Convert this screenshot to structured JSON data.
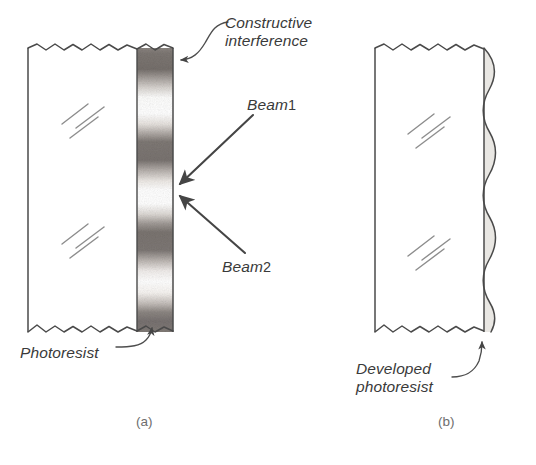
{
  "figure": {
    "kind": "technical-line-diagram",
    "background_color": "#ffffff",
    "ink_color": "#3a3a3a",
    "panels": [
      {
        "id": "a",
        "caption": "(a)",
        "description": "Substrate with photoresist layer exposed by two interfering beams",
        "annotations": [
          "Constructive interference",
          "Beam 1",
          "Beam 2",
          "Photoresist"
        ]
      },
      {
        "id": "b",
        "caption": "(b)",
        "description": "Substrate after development showing corrugated photoresist profile",
        "annotations": [
          "Developed photoresist"
        ]
      }
    ]
  },
  "labels": {
    "constructive_line1": "Constructive",
    "constructive_line2": "interference",
    "beam1_word": "Beam",
    "beam1_number": "1",
    "beam2_word": "Beam",
    "beam2_number": "2",
    "photoresist": "Photoresist",
    "developed_line1": "Developed",
    "developed_line2": "photoresist"
  },
  "captions": {
    "panel_a": "(a)",
    "panel_b": "(b)"
  },
  "colors": {
    "ink": "#3a3a3a",
    "line": "#4a4a4a",
    "fringe_dark": "#7a7572",
    "fringe_light": "#ffffff",
    "resist_fill": "#e8e6e2",
    "hatch": "#8a8a8a",
    "caption": "#6e6e6e",
    "background": "#ffffff"
  },
  "geometry": {
    "panel_a": {
      "substrate_left_x": 28,
      "substrate_right_x": 137,
      "top_y": 48,
      "bottom_y": 332,
      "resist_band_left_x": 137,
      "resist_band_right_x": 173,
      "fringe_count": 5
    },
    "panel_b": {
      "substrate_left_x": 375,
      "substrate_right_x": 484,
      "top_y": 48,
      "bottom_y": 332,
      "resist_straight_x": 484,
      "resist_wave_max_x": 498,
      "wave_count": 5
    }
  },
  "fringes": {
    "description": "Five dark constructive-interference bands alternating with light destructive bands within the photoresist layer of panel (a)",
    "dark_band_centers_y": [
      62,
      131,
      195,
      258,
      320
    ],
    "dark_band_height": 28
  },
  "arrows": [
    {
      "name": "constructive-interference-leader",
      "style": "thin-curved",
      "points_to_x": 174,
      "points_to_y": 60
    },
    {
      "name": "beam-1",
      "style": "thick-straight",
      "from_x": 252,
      "from_y": 116,
      "to_x": 175,
      "to_y": 187
    },
    {
      "name": "beam-2",
      "style": "thick-straight",
      "from_x": 244,
      "from_y": 252,
      "to_x": 175,
      "to_y": 194
    },
    {
      "name": "photoresist-leader",
      "style": "thin-curved",
      "points_to_x": 152,
      "points_to_y": 330
    },
    {
      "name": "developed-photoresist-leader",
      "style": "thin-curved",
      "points_to_x": 482,
      "points_to_y": 336
    }
  ],
  "hatch_groups": [
    {
      "name": "substrate-hatch-upper-a",
      "x": 62,
      "y": 100
    },
    {
      "name": "substrate-hatch-lower-a",
      "x": 62,
      "y": 220
    },
    {
      "name": "substrate-hatch-upper-b",
      "x": 408,
      "y": 110
    },
    {
      "name": "substrate-hatch-lower-b",
      "x": 408,
      "y": 232
    }
  ]
}
